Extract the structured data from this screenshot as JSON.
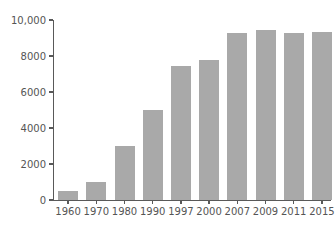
{
  "chart_data": {
    "type": "bar",
    "title": "",
    "subtitle": "",
    "xlabel": "",
    "ylabel": "",
    "categories": [
      "1960",
      "1970",
      "1980",
      "1990",
      "1997",
      "2000",
      "2007",
      "2009",
      "2011",
      "2015"
    ],
    "values": [
      500,
      1000,
      3000,
      5000,
      7450,
      7800,
      9300,
      9450,
      9270,
      9350
    ],
    "series": [
      {
        "name": "",
        "values": [
          500,
          1000,
          3000,
          5000,
          7450,
          7800,
          9300,
          9450,
          9270,
          9350
        ]
      }
    ],
    "ylim": [
      0,
      10000
    ],
    "y_ticks": [
      0,
      2000,
      4000,
      6000,
      8000,
      10000
    ],
    "y_tick_labels": [
      "0",
      "2000",
      "4000",
      "6000",
      "8000",
      "10,000"
    ],
    "grid": false,
    "legend": false,
    "legend_position": "none",
    "bar_color": "#a9a9a9",
    "axis_color": "#595959",
    "text_color": "#555555",
    "background_color": "#ffffff"
  }
}
